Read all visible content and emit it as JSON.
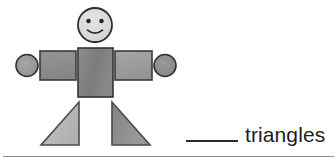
{
  "page": {
    "kind": "math-worksheet-item",
    "background_color": "#ffffff"
  },
  "figure": {
    "name": "shape-person",
    "parts": {
      "head": {
        "shape": "circle",
        "label": "head",
        "fill": "#dcdcdc",
        "stroke": "#2f2f2f",
        "cx": 95,
        "cy": 25,
        "r": 17
      },
      "face": {
        "eye_left": {
          "cx": 88,
          "cy": 21,
          "r": 2.2,
          "fill": "#262626"
        },
        "eye_right": {
          "cx": 102,
          "cy": 21,
          "r": 2.2,
          "fill": "#262626"
        },
        "smile_stroke": "#262626"
      },
      "torso": {
        "shape": "rectangle",
        "label": "torso",
        "fill": "#818181",
        "stroke": "#333333",
        "x": 78,
        "y": 48,
        "width": 35,
        "height": 49
      },
      "arm_left": {
        "shape": "rectangle",
        "label": "left arm",
        "fill": "#8c8c8c",
        "stroke": "#3a3a3a",
        "x": 40,
        "y": 51,
        "width": 36,
        "height": 29
      },
      "arm_right": {
        "shape": "rectangle",
        "label": "right arm",
        "fill": "#9b9b9b",
        "stroke": "#3a3a3a",
        "x": 115,
        "y": 51,
        "width": 37,
        "height": 29
      },
      "hand_left": {
        "shape": "circle",
        "label": "left hand",
        "fill": "#9a9a9a",
        "stroke": "#333333",
        "cx": 27,
        "cy": 65,
        "r": 11
      },
      "hand_right": {
        "shape": "circle",
        "label": "right hand",
        "fill": "#8f8f8f",
        "stroke": "#333333",
        "cx": 165,
        "cy": 65,
        "r": 11
      },
      "leg_left": {
        "shape": "triangle",
        "label": "left leg",
        "fill": "#b9b9b9",
        "stroke": "#4a4a4a",
        "points": "79,102 79,145 41,145"
      },
      "leg_right": {
        "shape": "triangle",
        "label": "right leg",
        "fill": "#8e8e8e",
        "stroke": "#4a4a4a",
        "points": "112,102 112,145 150,145"
      }
    },
    "shape_counts": {
      "circles": 3,
      "rectangles": 3,
      "triangles": 2
    }
  },
  "question": {
    "blank_placeholder": "",
    "label": "triangles"
  },
  "colors": {
    "ink": "#1d1d1d",
    "rule": "#8d8d8d",
    "blank_line": "#2b2b2b"
  }
}
